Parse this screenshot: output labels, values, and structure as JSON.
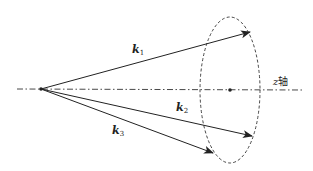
{
  "diagram": {
    "title": "",
    "colors": {
      "line": "#222222",
      "background": "#ffffff"
    },
    "axis": {
      "label_var": "z",
      "label_text": "轴",
      "style": "dash-dot"
    },
    "origin": {
      "x": 41,
      "y": 89
    },
    "ellipse": {
      "cx": 230,
      "cy": 90,
      "rx": 30,
      "ry": 73,
      "style": "dashed",
      "center_dot": true
    },
    "vectors": [
      {
        "id": "k1",
        "base": "k",
        "sub": "1",
        "end": [
          250,
          32
        ]
      },
      {
        "id": "k2",
        "base": "k",
        "sub": "2",
        "end": [
          252,
          136
        ]
      },
      {
        "id": "k3",
        "base": "k",
        "sub": "3",
        "end": [
          213,
          153
        ]
      }
    ]
  }
}
